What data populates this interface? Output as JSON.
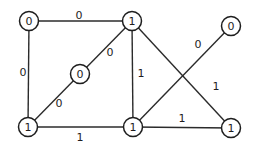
{
  "diagram": {
    "type": "graph",
    "colors": {
      "stroke": "#1e1e1e",
      "background": "#ffffff"
    },
    "nodes": [
      {
        "id": "A",
        "label": "0",
        "x": 29,
        "y": 21
      },
      {
        "id": "B",
        "label": "1",
        "x": 132,
        "y": 21
      },
      {
        "id": "C",
        "label": "0",
        "x": 231,
        "y": 26
      },
      {
        "id": "D",
        "label": "0",
        "x": 80,
        "y": 74
      },
      {
        "id": "F",
        "label": "1",
        "x": 28,
        "y": 127
      },
      {
        "id": "G",
        "label": "1",
        "x": 133,
        "y": 127
      },
      {
        "id": "H",
        "label": "1",
        "x": 231,
        "y": 128
      }
    ],
    "edges": [
      {
        "from": "A",
        "to": "B",
        "label": "0",
        "lx": 79,
        "ly": 15
      },
      {
        "from": "A",
        "to": "F",
        "label": "0",
        "lx": 23,
        "ly": 72
      },
      {
        "from": "B",
        "to": "D",
        "label": "0",
        "lx": 110,
        "ly": 52
      },
      {
        "from": "D",
        "to": "F",
        "label": "0",
        "lx": 59,
        "ly": 103
      },
      {
        "from": "B",
        "to": "G",
        "label": "1",
        "lx": 141,
        "ly": 73
      },
      {
        "from": "B",
        "to": "H",
        "label": "1",
        "lx": 216,
        "ly": 86
      },
      {
        "from": "G",
        "to": "C",
        "label": "0",
        "lx": 198,
        "ly": 44
      },
      {
        "from": "F",
        "to": "G",
        "label": "1",
        "lx": 80,
        "ly": 137
      },
      {
        "from": "G",
        "to": "H",
        "label": "1",
        "lx": 182,
        "ly": 118
      }
    ]
  }
}
